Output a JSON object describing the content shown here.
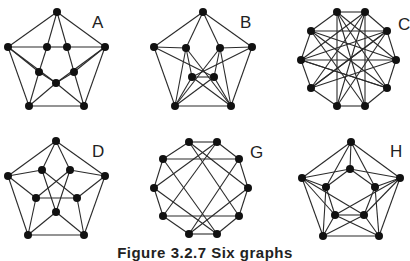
{
  "figure": {
    "caption": "Figure 3.2.7   Six graphs",
    "graphs": [
      {
        "id": "A",
        "label": "A",
        "label_pos": [
          92,
          28
        ],
        "nodes": [
          [
            57,
            12
          ],
          [
            8,
            47
          ],
          [
            47,
            47
          ],
          [
            67,
            47
          ],
          [
            105,
            47
          ],
          [
            39,
            72
          ],
          [
            74,
            72
          ],
          [
            56,
            83
          ],
          [
            29,
            106
          ],
          [
            84,
            106
          ]
        ],
        "edges": [
          [
            0,
            1
          ],
          [
            0,
            4
          ],
          [
            0,
            2
          ],
          [
            0,
            3
          ],
          [
            1,
            2
          ],
          [
            2,
            3
          ],
          [
            3,
            4
          ],
          [
            1,
            5
          ],
          [
            1,
            7
          ],
          [
            4,
            6
          ],
          [
            4,
            7
          ],
          [
            2,
            5
          ],
          [
            5,
            8
          ],
          [
            3,
            6
          ],
          [
            6,
            9
          ],
          [
            5,
            7
          ],
          [
            6,
            7
          ],
          [
            7,
            8
          ],
          [
            7,
            9
          ],
          [
            1,
            8
          ],
          [
            4,
            9
          ],
          [
            8,
            9
          ]
        ]
      },
      {
        "id": "B",
        "label": "B",
        "label_pos": [
          240,
          28
        ],
        "nodes": [
          [
            203,
            12
          ],
          [
            154,
            47
          ],
          [
            186,
            48
          ],
          [
            220,
            48
          ],
          [
            252,
            47
          ],
          [
            192,
            77
          ],
          [
            214,
            77
          ],
          [
            175,
            106
          ],
          [
            231,
            106
          ]
        ],
        "edges": [
          [
            0,
            1
          ],
          [
            0,
            4
          ],
          [
            0,
            2
          ],
          [
            0,
            3
          ],
          [
            1,
            2
          ],
          [
            3,
            4
          ],
          [
            1,
            7
          ],
          [
            4,
            8
          ],
          [
            1,
            6
          ],
          [
            4,
            5
          ],
          [
            2,
            5
          ],
          [
            2,
            7
          ],
          [
            3,
            6
          ],
          [
            3,
            8
          ],
          [
            5,
            6
          ],
          [
            5,
            8
          ],
          [
            6,
            7
          ],
          [
            7,
            8
          ],
          [
            5,
            7
          ],
          [
            6,
            8
          ],
          [
            2,
            8
          ],
          [
            3,
            7
          ]
        ]
      },
      {
        "id": "C",
        "label": "C",
        "label_pos": [
          398,
          30
        ],
        "nodes": [
          [
            337,
            12
          ],
          [
            365,
            12
          ],
          [
            387,
            31
          ],
          [
            396,
            60
          ],
          [
            387,
            88
          ],
          [
            365,
            106
          ],
          [
            337,
            106
          ],
          [
            311,
            88
          ],
          [
            301,
            60
          ],
          [
            311,
            31
          ]
        ],
        "edges": [
          [
            0,
            1
          ],
          [
            1,
            2
          ],
          [
            2,
            3
          ],
          [
            3,
            4
          ],
          [
            4,
            5
          ],
          [
            5,
            6
          ],
          [
            6,
            7
          ],
          [
            7,
            8
          ],
          [
            8,
            9
          ],
          [
            9,
            0
          ],
          [
            0,
            6
          ],
          [
            1,
            5
          ],
          [
            0,
            4
          ],
          [
            0,
            5
          ],
          [
            0,
            3
          ],
          [
            1,
            7
          ],
          [
            1,
            6
          ],
          [
            1,
            8
          ],
          [
            9,
            3
          ],
          [
            9,
            4
          ],
          [
            9,
            2
          ],
          [
            2,
            8
          ],
          [
            2,
            7
          ],
          [
            8,
            3
          ],
          [
            8,
            4
          ],
          [
            7,
            3
          ],
          [
            7,
            2
          ],
          [
            6,
            2
          ],
          [
            5,
            9
          ],
          [
            4,
            8
          ]
        ]
      },
      {
        "id": "D",
        "label": "D",
        "label_pos": [
          92,
          157
        ],
        "nodes": [
          [
            56,
            141
          ],
          [
            8,
            176
          ],
          [
            105,
            176
          ],
          [
            42,
            170
          ],
          [
            70,
            170
          ],
          [
            36,
            198
          ],
          [
            77,
            198
          ],
          [
            56,
            212
          ],
          [
            28,
            235
          ],
          [
            84,
            235
          ]
        ],
        "edges": [
          [
            0,
            1
          ],
          [
            0,
            2
          ],
          [
            0,
            3
          ],
          [
            0,
            4
          ],
          [
            1,
            3
          ],
          [
            2,
            4
          ],
          [
            1,
            5
          ],
          [
            2,
            6
          ],
          [
            1,
            8
          ],
          [
            2,
            9
          ],
          [
            3,
            6
          ],
          [
            4,
            5
          ],
          [
            3,
            7
          ],
          [
            4,
            7
          ],
          [
            5,
            6
          ],
          [
            5,
            8
          ],
          [
            6,
            9
          ],
          [
            7,
            8
          ],
          [
            7,
            9
          ],
          [
            8,
            9
          ]
        ]
      },
      {
        "id": "G",
        "label": "G",
        "label_pos": [
          250,
          158
        ],
        "nodes": [
          [
            189,
            142
          ],
          [
            217,
            142
          ],
          [
            239,
            159
          ],
          [
            248,
            188
          ],
          [
            239,
            216
          ],
          [
            217,
            234
          ],
          [
            189,
            234
          ],
          [
            163,
            216
          ],
          [
            154,
            188
          ],
          [
            163,
            159
          ]
        ],
        "edges": [
          [
            0,
            1
          ],
          [
            1,
            2
          ],
          [
            2,
            3
          ],
          [
            3,
            4
          ],
          [
            4,
            5
          ],
          [
            5,
            6
          ],
          [
            6,
            7
          ],
          [
            7,
            8
          ],
          [
            8,
            9
          ],
          [
            9,
            0
          ],
          [
            9,
            2
          ],
          [
            7,
            4
          ],
          [
            0,
            3
          ],
          [
            1,
            8
          ],
          [
            0,
            4
          ],
          [
            1,
            7
          ],
          [
            2,
            6
          ],
          [
            9,
            5
          ],
          [
            3,
            6
          ],
          [
            8,
            5
          ]
        ]
      },
      {
        "id": "H",
        "label": "H",
        "label_pos": [
          390,
          157
        ],
        "nodes": [
          [
            351,
            142
          ],
          [
            302,
            178
          ],
          [
            400,
            178
          ],
          [
            323,
            236
          ],
          [
            379,
            236
          ],
          [
            350,
            169
          ],
          [
            326,
            187
          ],
          [
            375,
            187
          ],
          [
            335,
            215
          ],
          [
            364,
            215
          ]
        ],
        "edges": [
          [
            0,
            1
          ],
          [
            0,
            2
          ],
          [
            1,
            3
          ],
          [
            2,
            4
          ],
          [
            3,
            4
          ],
          [
            0,
            5
          ],
          [
            0,
            6
          ],
          [
            0,
            7
          ],
          [
            5,
            6
          ],
          [
            5,
            7
          ],
          [
            6,
            8
          ],
          [
            7,
            9
          ],
          [
            8,
            9
          ],
          [
            1,
            5
          ],
          [
            1,
            6
          ],
          [
            1,
            8
          ],
          [
            1,
            9
          ],
          [
            2,
            5
          ],
          [
            2,
            7
          ],
          [
            2,
            9
          ],
          [
            2,
            8
          ],
          [
            3,
            6
          ],
          [
            3,
            8
          ],
          [
            3,
            9
          ],
          [
            4,
            7
          ],
          [
            4,
            9
          ],
          [
            4,
            8
          ]
        ]
      }
    ]
  }
}
